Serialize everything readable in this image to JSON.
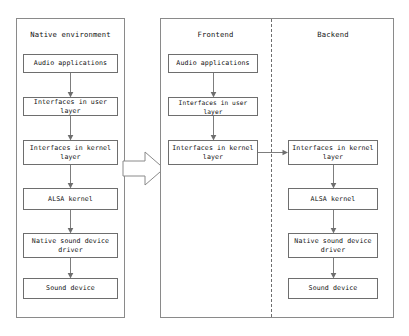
{
  "diagram": {
    "title_native": "Native environment",
    "title_frontend": "Frontend",
    "title_backend": "Backend",
    "panels": [
      {
        "id": "native",
        "label": "Native environment",
        "nodes": [
          "Audio applications",
          "Interfaces in user layer",
          "Interfaces in kernel layer",
          "ALSA kernel",
          "Native sound device driver",
          "Sound device"
        ]
      },
      {
        "id": "frontend",
        "label": "Frontend",
        "nodes": [
          "Audio applications",
          "Interfaces in user layer",
          "Interfaces in kernel layer"
        ]
      },
      {
        "id": "backend",
        "label": "Backend",
        "nodes": [
          "Interfaces in kernel layer",
          "ALSA kernel",
          "Native sound device driver",
          "Sound device"
        ]
      }
    ],
    "nodes": {
      "n_audio_apps": "Audio applications",
      "n_user_layer": "Interfaces in user layer",
      "n_kernel_layer_line1": "Interfaces in kernel",
      "n_kernel_layer_line2": "layer",
      "n_alsa_kernel": "ALSA kernel",
      "n_native_driver_line1": "Native sound device",
      "n_native_driver_line2": "driver",
      "n_sound_device": "Sound device",
      "f_audio_apps": "Audio applications",
      "f_user_layer": "Interfaces in user layer",
      "f_kernel_layer_line1": "Interfaces in kernel",
      "f_kernel_layer_line2": "layer",
      "b_kernel_layer_line1": "Interfaces in kernel",
      "b_kernel_layer_line2": "layer",
      "b_alsa_kernel": "ALSA kernel",
      "b_native_driver_line1": "Native sound device",
      "b_native_driver_line2": "driver",
      "b_sound_device": "Sound device"
    },
    "colors": {
      "panel_border": "#8a8a8a",
      "node_border": "#6e6e6e",
      "connector": "#6e6e6e",
      "background": "#ffffff",
      "text": "#111111"
    }
  }
}
